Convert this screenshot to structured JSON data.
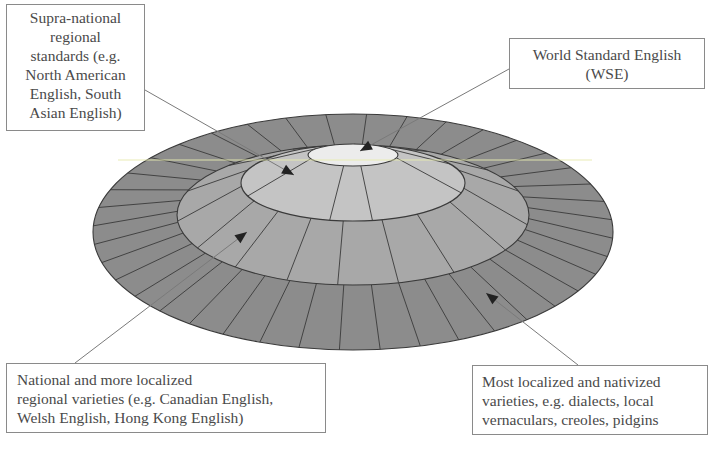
{
  "diagram": {
    "type": "concentric-ellipse-model",
    "colors": {
      "outer_ring": "#8c8c8c",
      "national_ring": "#a8a8a8",
      "supranational_ring": "#c4c4c4",
      "wse_core": "#ececec",
      "stroke": "#3a3a3a",
      "highlight_line": "#e8ebb0",
      "leader_line": "#7a7a7a",
      "arrowhead": "#222222"
    },
    "ellipses": [
      {
        "id": "localized",
        "cx": 353,
        "cy": 232,
        "rx": 260,
        "ry": 118
      },
      {
        "id": "national",
        "cx": 353,
        "cy": 215,
        "rx": 176,
        "ry": 70
      },
      {
        "id": "supranational",
        "cx": 353,
        "cy": 183,
        "rx": 112,
        "ry": 38
      },
      {
        "id": "wse",
        "cx": 353,
        "cy": 155,
        "rx": 45,
        "ry": 11
      }
    ]
  },
  "labels": {
    "supranational": {
      "lines": [
        "Supra-national",
        "regional",
        "standards (e.g.",
        "North American",
        "English, South",
        "Asian English)"
      ]
    },
    "wse": {
      "lines": [
        "World Standard English",
        "(WSE)"
      ]
    },
    "national": {
      "lines": [
        "National and more localized",
        "regional varieties (e.g. Canadian English,",
        "Welsh English, Hong Kong English)"
      ]
    },
    "localized": {
      "lines": [
        "Most localized and nativized",
        "varieties, e.g. dialects, local",
        "vernaculars, creoles, pidgins"
      ]
    }
  }
}
